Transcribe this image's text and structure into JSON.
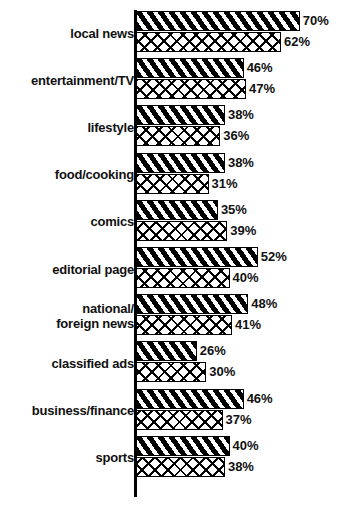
{
  "chart_data": {
    "type": "bar",
    "orientation": "horizontal",
    "title": "",
    "xlabel": "",
    "ylabel": "",
    "xlim": [
      0,
      70
    ],
    "grid": false,
    "legend": "none",
    "value_suffix": "%",
    "categories": [
      "local news",
      "entertainment/TV",
      "lifestyle",
      "food/cooking",
      "comics",
      "editorial page",
      "national/ foreign news",
      "classified ads",
      "business/finance",
      "sports"
    ],
    "category_lines": [
      [
        "local news"
      ],
      [
        "entertainment/TV"
      ],
      [
        "lifestyle"
      ],
      [
        "food/cooking"
      ],
      [
        "comics"
      ],
      [
        "editorial page"
      ],
      [
        "national/",
        "foreign news"
      ],
      [
        "classified ads"
      ],
      [
        "business/finance"
      ],
      [
        "sports"
      ]
    ],
    "series": [
      {
        "name": "series-1",
        "pattern": "black-diagonal-stripes",
        "values": [
          70,
          46,
          38,
          38,
          35,
          52,
          48,
          26,
          46,
          40
        ],
        "labels": [
          "70%",
          "46%",
          "38%",
          "38%",
          "35%",
          "52%",
          "48%",
          "26%",
          "46%",
          "40%"
        ]
      },
      {
        "name": "series-2",
        "pattern": "white-crosshatch",
        "values": [
          62,
          47,
          36,
          31,
          39,
          40,
          41,
          30,
          37,
          38
        ],
        "labels": [
          "62%",
          "47%",
          "36%",
          "31%",
          "39%",
          "40%",
          "41%",
          "30%",
          "37%",
          "38%"
        ]
      }
    ],
    "colors": {
      "series_1_fill": "#000000",
      "series_1_stripe": "#ffffff",
      "series_2_fill": "#ffffff",
      "series_2_hatch": "#000000",
      "axis": "#000000",
      "text": "#111111",
      "background": "#ffffff"
    }
  }
}
